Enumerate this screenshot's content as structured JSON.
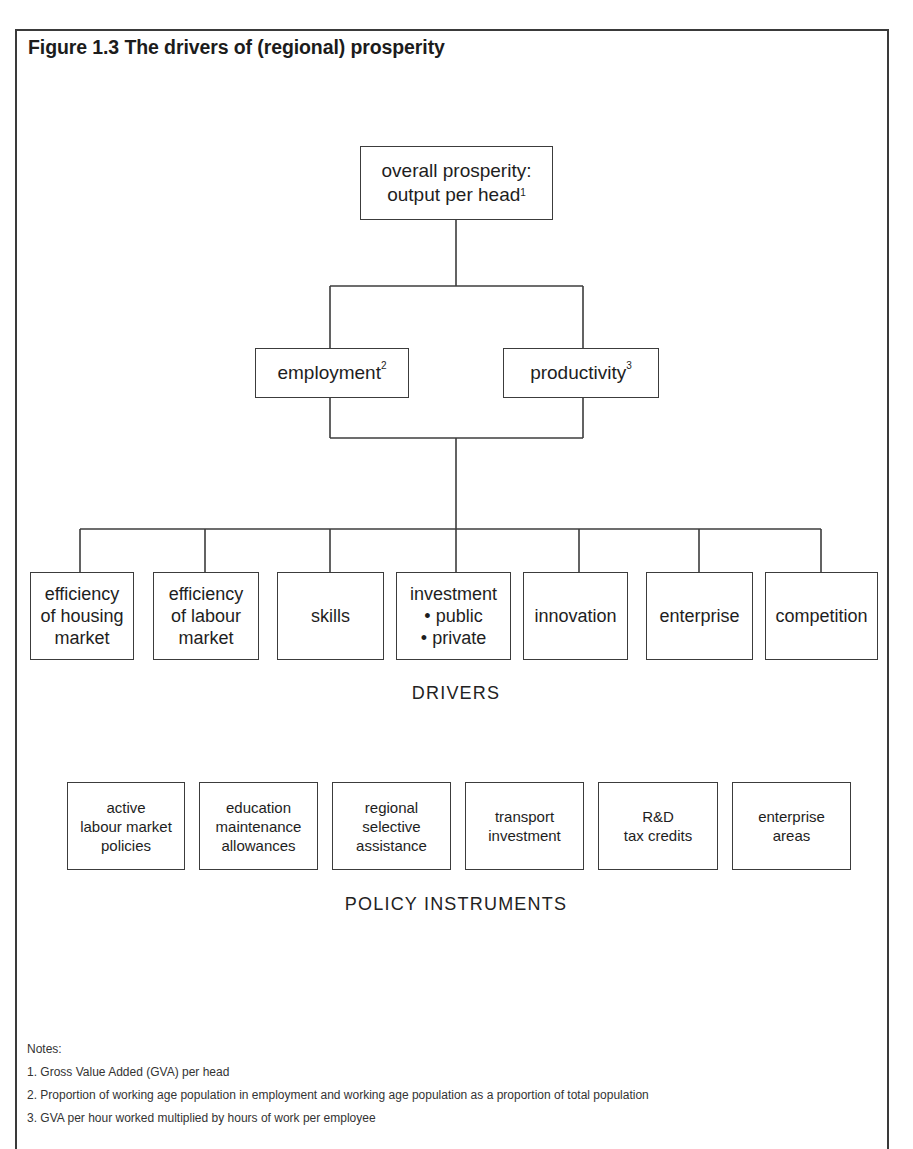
{
  "figure": {
    "title": "Figure 1.3 The drivers of (regional) prosperity"
  },
  "top": {
    "line1": "overall prosperity:",
    "line2": "output per head",
    "footnote": "1"
  },
  "mid": [
    {
      "label": "employment",
      "footnote": "2"
    },
    {
      "label": "productivity",
      "footnote": "3"
    }
  ],
  "drivers": {
    "section_label": "DRIVERS",
    "items": [
      {
        "lines": [
          "efficiency",
          "of housing",
          "market"
        ]
      },
      {
        "lines": [
          "efficiency",
          "of labour",
          "market"
        ]
      },
      {
        "lines": [
          "skills"
        ]
      },
      {
        "lines": [
          "investment",
          "• public",
          "• private"
        ]
      },
      {
        "lines": [
          "innovation"
        ]
      },
      {
        "lines": [
          "enterprise"
        ]
      },
      {
        "lines": [
          "competition"
        ]
      }
    ]
  },
  "policy": {
    "section_label": "POLICY INSTRUMENTS",
    "items": [
      {
        "lines": [
          "active",
          "labour market",
          "policies"
        ]
      },
      {
        "lines": [
          "education",
          "maintenance",
          "allowances"
        ]
      },
      {
        "lines": [
          "regional",
          "selective",
          "assistance"
        ]
      },
      {
        "lines": [
          "transport",
          "investment"
        ]
      },
      {
        "lines": [
          "R&D",
          "tax credits"
        ]
      },
      {
        "lines": [
          "enterprise",
          "areas"
        ]
      }
    ]
  },
  "notes": {
    "heading": "Notes:",
    "items": [
      "1. Gross Value Added (GVA) per head",
      "2. Proportion of working age population in employment and working age population as a proportion of total population",
      "3. GVA per hour worked multiplied by hours of work per employee"
    ]
  },
  "colors": {
    "line": "#3c3c3c",
    "text": "#1e1e1e",
    "background": "#ffffff"
  }
}
